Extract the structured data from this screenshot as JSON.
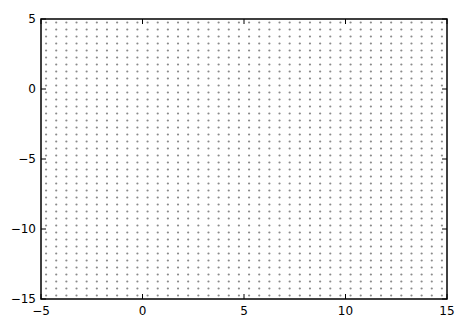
{
  "chart_data": {
    "type": "scatter",
    "title": "",
    "xlabel": "",
    "ylabel": "",
    "xlim": [
      -5,
      15
    ],
    "ylim": [
      -15,
      5
    ],
    "grid": false,
    "legend": null,
    "xticks": [
      -5,
      0,
      5,
      10,
      15
    ],
    "yticks": [
      5,
      0,
      -5,
      -10,
      -15
    ],
    "xtick_labels": [
      "−5",
      "0",
      "5",
      "10",
      "15"
    ],
    "ytick_labels": [
      "5",
      "0",
      "−5",
      "−10",
      "−15"
    ],
    "series": [
      {
        "name": "grid points",
        "marker": "dot",
        "color": "#8a8a8a",
        "x_start": -4.75,
        "x_end": 14.75,
        "x_step": 0.5,
        "y_start": 4.75,
        "y_end": -14.75,
        "y_step": -0.5,
        "count_x": 40,
        "count_y": 40
      }
    ]
  },
  "style": {
    "frame_color": "#000000",
    "point_color": "#8a8a8a",
    "background": "#ffffff"
  },
  "layout": {
    "plot_left": 41,
    "plot_right": 447,
    "plot_top": 19,
    "plot_bottom": 299
  }
}
